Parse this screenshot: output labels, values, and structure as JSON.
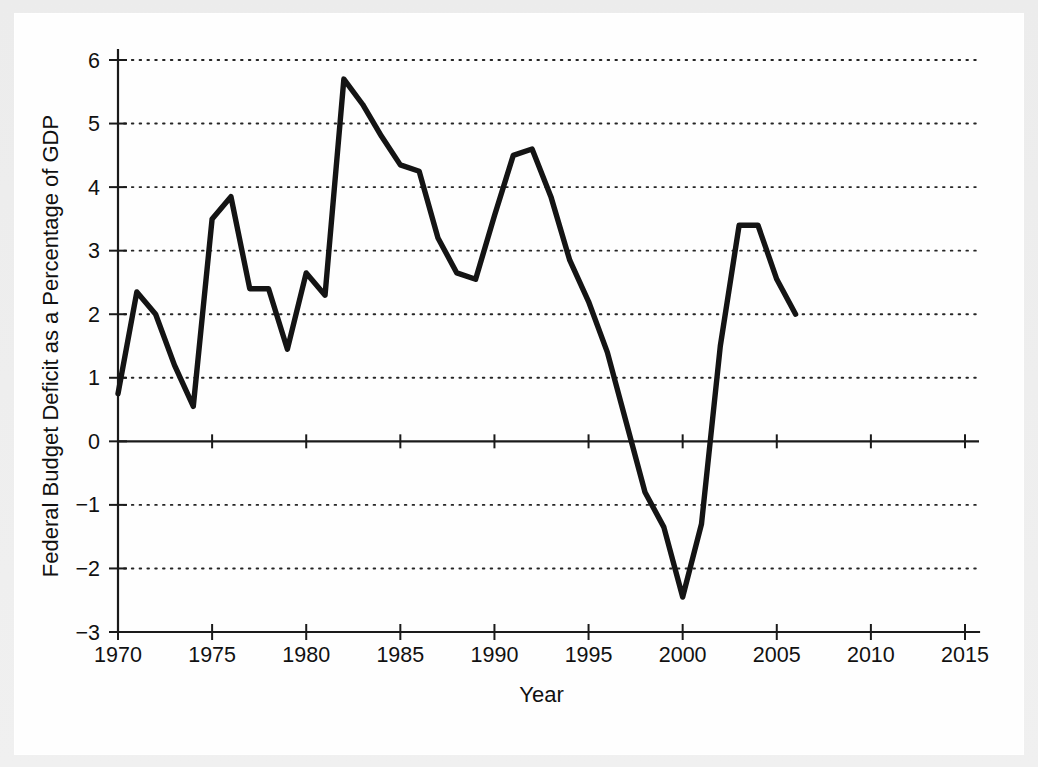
{
  "figure": {
    "background_color": "#fefefe",
    "scan_border_color": "#ececec",
    "line_color": "#141414",
    "axis_color": "#1a1a1a"
  },
  "chart_data": {
    "type": "line",
    "title": "",
    "xlabel": "Year",
    "ylabel": "Federal Budget Deficit as a Percentage of GDP",
    "xlim": [
      1970,
      2015
    ],
    "ylim": [
      -3,
      6
    ],
    "xticks": [
      1970,
      1975,
      1980,
      1985,
      1990,
      1995,
      2000,
      2005,
      2010,
      2015
    ],
    "xtick_labels": [
      "1970",
      "1975",
      "1980",
      "1985",
      "1990",
      "1995",
      "2000",
      "2005",
      "2010",
      "2015"
    ],
    "yticks": [
      -3,
      -2,
      -1,
      0,
      1,
      2,
      3,
      4,
      5,
      6
    ],
    "ytick_labels": [
      "−3",
      "−2",
      "−1",
      "0",
      "1",
      "2",
      "3",
      "4",
      "5",
      "6"
    ],
    "grid": true,
    "grid_style": "dotted-horizontal",
    "zero_line": true,
    "legend": "none",
    "x": [
      1970,
      1971,
      1972,
      1973,
      1974,
      1975,
      1976,
      1977,
      1978,
      1979,
      1980,
      1981,
      1982,
      1983,
      1984,
      1985,
      1986,
      1987,
      1988,
      1989,
      1990,
      1991,
      1992,
      1993,
      1994,
      1995,
      1996,
      1997,
      1998,
      1999,
      2000,
      2001,
      2002,
      2003,
      2004,
      2005,
      2006
    ],
    "values": [
      0.75,
      2.35,
      2.0,
      1.2,
      0.55,
      3.5,
      3.85,
      2.4,
      2.4,
      1.45,
      2.65,
      2.3,
      5.7,
      5.3,
      4.8,
      4.35,
      4.25,
      3.2,
      2.65,
      2.55,
      3.55,
      4.5,
      4.6,
      3.85,
      2.85,
      2.2,
      1.4,
      0.3,
      -0.8,
      -1.35,
      -2.45,
      -1.3,
      1.5,
      3.4,
      3.4,
      2.55,
      2.0
    ]
  }
}
